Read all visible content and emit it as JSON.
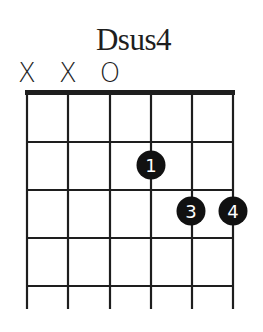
{
  "chord": {
    "name": "Dsus4",
    "string_markers": [
      {
        "string": 6,
        "symbol": "X",
        "x": 27
      },
      {
        "string": 5,
        "symbol": "X",
        "x": 68
      },
      {
        "string": 4,
        "symbol": "O",
        "x": 110
      }
    ],
    "fingers": [
      {
        "label": "1",
        "string": 3,
        "fret": 2
      },
      {
        "label": "3",
        "string": 2,
        "fret": 3
      },
      {
        "label": "4",
        "string": 1,
        "fret": 3
      }
    ]
  },
  "colors": {
    "line": "#1e1e1e",
    "dot": "#111111",
    "dot_text": "#ffffff",
    "background": "#ffffff"
  }
}
